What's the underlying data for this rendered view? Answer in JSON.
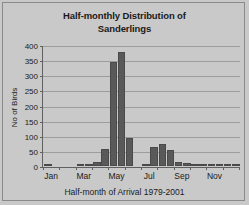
{
  "chart_data": {
    "type": "bar",
    "title": "Half-monthly Distribution of Sanderlings",
    "title_line1": "Half-monthly Distribution of",
    "title_line2": "Sanderlings",
    "xlabel": "Half-month of Arrival 1979-2001",
    "ylabel": "No of Birds",
    "ylim": [
      0,
      400
    ],
    "ytick_values": [
      0,
      50,
      100,
      150,
      200,
      250,
      300,
      350,
      400
    ],
    "ytick_labels": [
      "0",
      "50",
      "100",
      "150",
      "200",
      "250",
      "300",
      "350",
      "400"
    ],
    "grid": true,
    "legend": false,
    "bar_color": "#595959",
    "plot_background": "#c9c9c9",
    "categories": [
      "Jan 1",
      "Jan 2",
      "Feb 1",
      "Feb 2",
      "Mar 1",
      "Mar 2",
      "Apr 1",
      "Apr 2",
      "May 1",
      "May 2",
      "Jun 1",
      "Jun 2",
      "Jul 1",
      "Jul 2",
      "Aug 1",
      "Aug 2",
      "Sep 1",
      "Sep 2",
      "Oct 1",
      "Oct 2",
      "Nov 1",
      "Nov 2",
      "Dec 1",
      "Dec 2"
    ],
    "values": [
      5,
      0,
      0,
      0,
      2,
      4,
      15,
      60,
      348,
      380,
      97,
      0,
      6,
      67,
      77,
      57,
      17,
      13,
      9,
      7,
      11,
      3,
      2,
      7
    ],
    "xtick_labels": [
      "Jan",
      "Mar",
      "May",
      "Jul",
      "Sep",
      "Nov"
    ],
    "xtick_categories": [
      "Jan 1",
      "Mar 1",
      "May 1",
      "Jul 1",
      "Sep 1",
      "Nov 1"
    ]
  }
}
